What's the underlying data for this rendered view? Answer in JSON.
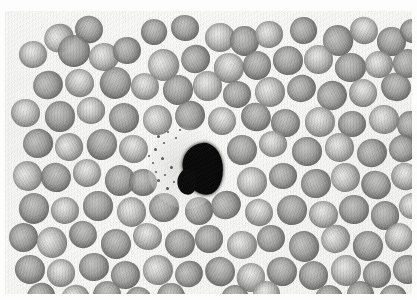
{
  "figure": {
    "title": "Peripheral blood smear photomicrograph",
    "modality": "Brightfield light microscopy",
    "staining": "Romanowsky (grayscale reproduction)",
    "caption": "",
    "width_px": 417,
    "height_px": 300
  },
  "frame": {
    "margin_color": "#fdfdfd",
    "field_left": 5,
    "field_top": 11,
    "field_width": 407,
    "field_height": 283
  },
  "colors": {
    "background": "#f2f2f1",
    "field_light": "#f6f6f4",
    "rbc_rim": "#7c7c7a",
    "rbc_center": "#d6d6d4",
    "wbc_nucleus": "#0b0b0b",
    "wbc_cytoplasm": "#d6d6d4",
    "granule": "#383836"
  },
  "field_contents": {
    "erythrocyte_label": "red blood cell",
    "leukocyte_label": "white blood cell nucleus",
    "cytoplasm_label": "leukocyte cytoplasm",
    "granule_label": "cytoplasmic granule"
  },
  "wbc": {
    "nucleus": {
      "x": 178,
      "y": 132,
      "w": 40,
      "h": 52,
      "rotation": -6
    },
    "cytoplasm": {
      "x": 143,
      "y": 116,
      "w": 74,
      "h": 82
    },
    "granules": [
      {
        "x": 152,
        "y": 124,
        "d": 3
      },
      {
        "x": 158,
        "y": 131,
        "d": 2
      },
      {
        "x": 149,
        "y": 137,
        "d": 3
      },
      {
        "x": 162,
        "y": 120,
        "d": 2
      },
      {
        "x": 156,
        "y": 146,
        "d": 3
      },
      {
        "x": 147,
        "y": 151,
        "d": 2
      },
      {
        "x": 165,
        "y": 155,
        "d": 3
      },
      {
        "x": 159,
        "y": 163,
        "d": 2
      },
      {
        "x": 152,
        "y": 168,
        "d": 3
      },
      {
        "x": 170,
        "y": 126,
        "d": 2
      },
      {
        "x": 143,
        "y": 144,
        "d": 2
      },
      {
        "x": 168,
        "y": 170,
        "d": 2
      },
      {
        "x": 174,
        "y": 118,
        "d": 2
      },
      {
        "x": 161,
        "y": 176,
        "d": 3
      },
      {
        "x": 150,
        "y": 160,
        "d": 2
      }
    ]
  },
  "rbcs": [
    {
      "x": 39,
      "y": 13,
      "d": 30,
      "t": "light"
    },
    {
      "x": 70,
      "y": 5,
      "d": 28,
      "t": "dark"
    },
    {
      "x": 136,
      "y": 8,
      "d": 26,
      "t": "dark"
    },
    {
      "x": 166,
      "y": 4,
      "d": 28,
      "t": "dark"
    },
    {
      "x": 200,
      "y": 12,
      "d": 30,
      "t": "light"
    },
    {
      "x": 225,
      "y": 15,
      "d": 29,
      "t": "dark"
    },
    {
      "x": 250,
      "y": 10,
      "d": 28,
      "t": "light"
    },
    {
      "x": 285,
      "y": 6,
      "d": 27,
      "t": "dark"
    },
    {
      "x": 318,
      "y": 14,
      "d": 30,
      "t": "dark"
    },
    {
      "x": 345,
      "y": 6,
      "d": 28,
      "t": "light"
    },
    {
      "x": 372,
      "y": 16,
      "d": 29,
      "t": "dark"
    },
    {
      "x": 395,
      "y": 8,
      "d": 26,
      "t": "dark"
    },
    {
      "x": 14,
      "y": 30,
      "d": 28,
      "t": "light"
    },
    {
      "x": 53,
      "y": 24,
      "d": 32,
      "t": "dark"
    },
    {
      "x": 84,
      "y": 32,
      "d": 30,
      "t": "light"
    },
    {
      "x": 108,
      "y": 26,
      "d": 28,
      "t": "dark"
    },
    {
      "x": 143,
      "y": 38,
      "d": 31,
      "t": "light"
    },
    {
      "x": 176,
      "y": 34,
      "d": 29,
      "t": "dark"
    },
    {
      "x": 209,
      "y": 42,
      "d": 30,
      "t": "light"
    },
    {
      "x": 238,
      "y": 40,
      "d": 28,
      "t": "dark"
    },
    {
      "x": 268,
      "y": 35,
      "d": 30,
      "t": "dark"
    },
    {
      "x": 299,
      "y": 34,
      "d": 29,
      "t": "light"
    },
    {
      "x": 330,
      "y": 42,
      "d": 31,
      "t": "dark"
    },
    {
      "x": 360,
      "y": 40,
      "d": 28,
      "t": "light"
    },
    {
      "x": 388,
      "y": 38,
      "d": 29,
      "t": "dark"
    },
    {
      "x": 28,
      "y": 60,
      "d": 30,
      "t": "dark"
    },
    {
      "x": 60,
      "y": 58,
      "d": 29,
      "t": "light"
    },
    {
      "x": 95,
      "y": 56,
      "d": 31,
      "t": "dark"
    },
    {
      "x": 126,
      "y": 62,
      "d": 28,
      "t": "light"
    },
    {
      "x": 158,
      "y": 64,
      "d": 30,
      "t": "dark"
    },
    {
      "x": 188,
      "y": 60,
      "d": 29,
      "t": "light"
    },
    {
      "x": 218,
      "y": 70,
      "d": 28,
      "t": "dark"
    },
    {
      "x": 250,
      "y": 66,
      "d": 30,
      "t": "light"
    },
    {
      "x": 282,
      "y": 64,
      "d": 29,
      "t": "dark"
    },
    {
      "x": 312,
      "y": 70,
      "d": 30,
      "t": "dark"
    },
    {
      "x": 344,
      "y": 68,
      "d": 28,
      "t": "light"
    },
    {
      "x": 376,
      "y": 62,
      "d": 30,
      "t": "dark"
    },
    {
      "x": 6,
      "y": 88,
      "d": 29,
      "t": "light"
    },
    {
      "x": 40,
      "y": 90,
      "d": 30,
      "t": "dark"
    },
    {
      "x": 72,
      "y": 86,
      "d": 28,
      "t": "light"
    },
    {
      "x": 104,
      "y": 92,
      "d": 30,
      "t": "dark"
    },
    {
      "x": 138,
      "y": 94,
      "d": 29,
      "t": "light"
    },
    {
      "x": 170,
      "y": 90,
      "d": 30,
      "t": "dark"
    },
    {
      "x": 203,
      "y": 96,
      "d": 28,
      "t": "light"
    },
    {
      "x": 236,
      "y": 92,
      "d": 30,
      "t": "dark"
    },
    {
      "x": 266,
      "y": 98,
      "d": 29,
      "t": "dark"
    },
    {
      "x": 300,
      "y": 96,
      "d": 30,
      "t": "light"
    },
    {
      "x": 333,
      "y": 100,
      "d": 28,
      "t": "dark"
    },
    {
      "x": 364,
      "y": 94,
      "d": 30,
      "t": "light"
    },
    {
      "x": 392,
      "y": 100,
      "d": 27,
      "t": "dark"
    },
    {
      "x": 18,
      "y": 118,
      "d": 30,
      "t": "dark"
    },
    {
      "x": 50,
      "y": 122,
      "d": 28,
      "t": "light"
    },
    {
      "x": 82,
      "y": 118,
      "d": 30,
      "t": "dark"
    },
    {
      "x": 114,
      "y": 124,
      "d": 29,
      "t": "light"
    },
    {
      "x": 222,
      "y": 124,
      "d": 30,
      "t": "dark"
    },
    {
      "x": 254,
      "y": 120,
      "d": 28,
      "t": "light"
    },
    {
      "x": 287,
      "y": 126,
      "d": 30,
      "t": "dark"
    },
    {
      "x": 320,
      "y": 122,
      "d": 29,
      "t": "light"
    },
    {
      "x": 352,
      "y": 128,
      "d": 30,
      "t": "dark"
    },
    {
      "x": 384,
      "y": 124,
      "d": 28,
      "t": "dark"
    },
    {
      "x": 8,
      "y": 150,
      "d": 29,
      "t": "light"
    },
    {
      "x": 36,
      "y": 152,
      "d": 30,
      "t": "dark"
    },
    {
      "x": 68,
      "y": 148,
      "d": 28,
      "t": "light"
    },
    {
      "x": 100,
      "y": 154,
      "d": 30,
      "t": "dark"
    },
    {
      "x": 124,
      "y": 158,
      "d": 28,
      "t": "dark"
    },
    {
      "x": 232,
      "y": 156,
      "d": 30,
      "t": "light"
    },
    {
      "x": 264,
      "y": 152,
      "d": 28,
      "t": "dark"
    },
    {
      "x": 296,
      "y": 158,
      "d": 30,
      "t": "dark"
    },
    {
      "x": 326,
      "y": 152,
      "d": 29,
      "t": "light"
    },
    {
      "x": 356,
      "y": 160,
      "d": 30,
      "t": "dark"
    },
    {
      "x": 386,
      "y": 152,
      "d": 28,
      "t": "light"
    },
    {
      "x": 14,
      "y": 182,
      "d": 30,
      "t": "dark"
    },
    {
      "x": 46,
      "y": 186,
      "d": 28,
      "t": "light"
    },
    {
      "x": 78,
      "y": 180,
      "d": 30,
      "t": "dark"
    },
    {
      "x": 112,
      "y": 186,
      "d": 29,
      "t": "light"
    },
    {
      "x": 144,
      "y": 182,
      "d": 30,
      "t": "dark"
    },
    {
      "x": 180,
      "y": 186,
      "d": 28,
      "t": "dark"
    },
    {
      "x": 206,
      "y": 180,
      "d": 30,
      "t": "dark"
    },
    {
      "x": 240,
      "y": 188,
      "d": 28,
      "t": "light"
    },
    {
      "x": 272,
      "y": 184,
      "d": 30,
      "t": "dark"
    },
    {
      "x": 304,
      "y": 190,
      "d": 29,
      "t": "light"
    },
    {
      "x": 334,
      "y": 184,
      "d": 30,
      "t": "dark"
    },
    {
      "x": 366,
      "y": 190,
      "d": 28,
      "t": "dark"
    },
    {
      "x": 394,
      "y": 182,
      "d": 27,
      "t": "light"
    },
    {
      "x": 4,
      "y": 212,
      "d": 29,
      "t": "dark"
    },
    {
      "x": 32,
      "y": 216,
      "d": 30,
      "t": "light"
    },
    {
      "x": 64,
      "y": 210,
      "d": 28,
      "t": "dark"
    },
    {
      "x": 96,
      "y": 218,
      "d": 30,
      "t": "dark"
    },
    {
      "x": 128,
      "y": 212,
      "d": 29,
      "t": "light"
    },
    {
      "x": 160,
      "y": 218,
      "d": 30,
      "t": "dark"
    },
    {
      "x": 190,
      "y": 214,
      "d": 28,
      "t": "dark"
    },
    {
      "x": 222,
      "y": 220,
      "d": 30,
      "t": "light"
    },
    {
      "x": 252,
      "y": 214,
      "d": 28,
      "t": "dark"
    },
    {
      "x": 284,
      "y": 220,
      "d": 30,
      "t": "dark"
    },
    {
      "x": 316,
      "y": 214,
      "d": 29,
      "t": "light"
    },
    {
      "x": 348,
      "y": 220,
      "d": 30,
      "t": "dark"
    },
    {
      "x": 380,
      "y": 212,
      "d": 28,
      "t": "light"
    },
    {
      "x": 10,
      "y": 244,
      "d": 30,
      "t": "dark"
    },
    {
      "x": 42,
      "y": 248,
      "d": 28,
      "t": "light"
    },
    {
      "x": 74,
      "y": 242,
      "d": 30,
      "t": "dark"
    },
    {
      "x": 106,
      "y": 250,
      "d": 29,
      "t": "dark"
    },
    {
      "x": 138,
      "y": 244,
      "d": 30,
      "t": "light"
    },
    {
      "x": 170,
      "y": 250,
      "d": 28,
      "t": "dark"
    },
    {
      "x": 200,
      "y": 246,
      "d": 30,
      "t": "dark"
    },
    {
      "x": 232,
      "y": 252,
      "d": 28,
      "t": "light"
    },
    {
      "x": 262,
      "y": 246,
      "d": 30,
      "t": "dark"
    },
    {
      "x": 294,
      "y": 250,
      "d": 29,
      "t": "dark"
    },
    {
      "x": 326,
      "y": 244,
      "d": 30,
      "t": "light"
    },
    {
      "x": 358,
      "y": 250,
      "d": 28,
      "t": "dark"
    },
    {
      "x": 388,
      "y": 244,
      "d": 29,
      "t": "dark"
    },
    {
      "x": 22,
      "y": 272,
      "d": 28,
      "t": "dark"
    },
    {
      "x": 56,
      "y": 274,
      "d": 29,
      "t": "light"
    },
    {
      "x": 88,
      "y": 270,
      "d": 28,
      "t": "dark"
    },
    {
      "x": 120,
      "y": 276,
      "d": 27,
      "t": "dark"
    },
    {
      "x": 152,
      "y": 272,
      "d": 28,
      "t": "dark"
    },
    {
      "x": 216,
      "y": 274,
      "d": 28,
      "t": "dark"
    },
    {
      "x": 248,
      "y": 270,
      "d": 27,
      "t": "light"
    },
    {
      "x": 310,
      "y": 274,
      "d": 28,
      "t": "dark"
    },
    {
      "x": 342,
      "y": 270,
      "d": 27,
      "t": "dark"
    },
    {
      "x": 374,
      "y": 274,
      "d": 28,
      "t": "dark"
    }
  ]
}
